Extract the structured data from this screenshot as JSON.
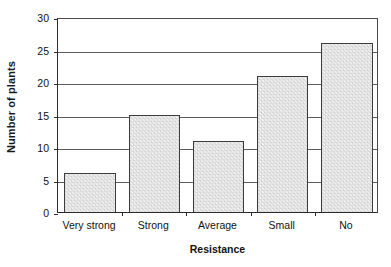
{
  "chart_data": {
    "type": "bar",
    "title": "",
    "xlabel": "Resistance",
    "ylabel": "Number of plants",
    "categories": [
      "Very strong",
      "Strong",
      "Average",
      "Small",
      "No"
    ],
    "values": [
      6,
      15,
      11,
      21,
      26
    ],
    "series": [
      {
        "name": "Number of plants",
        "values": [
          6,
          15,
          11,
          21,
          26
        ]
      }
    ],
    "ylim": [
      0,
      30
    ],
    "yticks": [
      0,
      5,
      10,
      15,
      20,
      25,
      30
    ],
    "ytick_labels": [
      "0",
      "5",
      "10",
      "15",
      "20",
      "25",
      "30"
    ],
    "grid": "horizontal",
    "legend": "none",
    "bar_fill_color": "#e2e2e2",
    "bar_border_color": "#3d3d3d",
    "axis_color": "#2b2b2b",
    "gridline_color": "#5c5c5c",
    "background_color": "#ffffff"
  }
}
